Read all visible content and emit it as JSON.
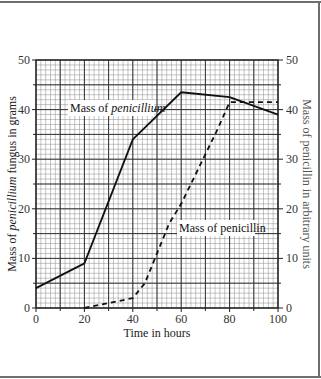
{
  "chart_data": {
    "type": "line",
    "title": "",
    "xlabel": "Time in hours",
    "ylabel_left": "Mass of penicillium fungus in grams",
    "ylabel_left_parts": [
      "Mass of ",
      "penicillium",
      " fungus in grams"
    ],
    "ylabel_right": "Mass of penicillin in arbitrary units",
    "xlim": [
      0,
      100
    ],
    "ylim": [
      0,
      50
    ],
    "ylim_right": [
      0,
      50
    ],
    "x_ticks": [
      0,
      20,
      40,
      60,
      80,
      100
    ],
    "y_ticks": [
      0,
      10,
      20,
      30,
      40,
      50
    ],
    "y_ticks_right": [
      0,
      10,
      20,
      30,
      40,
      50
    ],
    "grid": true,
    "grid_minor_step_x": 2,
    "grid_minor_step_y": 1,
    "series": [
      {
        "name": "Mass of penicillium",
        "label_parts": [
          "Mass of ",
          "penicillium"
        ],
        "style": "solid",
        "axis": "left",
        "x": [
          0,
          20,
          40,
          60,
          80,
          100
        ],
        "values": [
          4,
          9,
          34,
          43.5,
          42.5,
          39
        ]
      },
      {
        "name": "Mass of penicillin",
        "label_parts": [
          "Mass of penicillin"
        ],
        "style": "dashed",
        "axis": "right",
        "x": [
          20,
          30,
          40,
          45,
          50,
          55,
          60,
          65,
          70,
          75,
          80,
          100
        ],
        "values": [
          0,
          1,
          2,
          5,
          11,
          17,
          21,
          26,
          31,
          36,
          41.5,
          41.5
        ]
      }
    ]
  }
}
